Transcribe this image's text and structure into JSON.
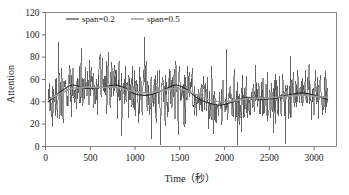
{
  "chart_data": {
    "type": "line",
    "title": "",
    "xlabel": "Time（秒）",
    "ylabel": "Attention",
    "xlim": [
      0,
      3250
    ],
    "ylim": [
      0,
      120
    ],
    "xticks": [
      0,
      500,
      1000,
      1500,
      2000,
      2500,
      3000
    ],
    "yticks": [
      0,
      20,
      40,
      60,
      80,
      100,
      120
    ],
    "xtick_labels": [
      "0",
      "500",
      "1000",
      "1500",
      "2000",
      "2500",
      "3000"
    ],
    "ytick_labels": [
      "0",
      "20",
      "40",
      "60",
      "80",
      "100",
      "120"
    ],
    "grid": false,
    "legend_position": "top-inside",
    "legend": [
      {
        "name": "span=0.2",
        "color": "#2b2b2b",
        "style": "solid"
      },
      {
        "name": "span=0.5",
        "color": "#9a9a9a",
        "style": "solid"
      }
    ],
    "series": [
      {
        "name": "attention-raw",
        "type": "noisy-line",
        "color": "#3a3a3a",
        "x_start": 30,
        "x_end": 3150,
        "n_points": 620,
        "description": "Raw per-second attention readings, high-frequency noise spanning roughly 0 to 100",
        "noise_amplitude": 22,
        "value_min": 0,
        "value_max": 100,
        "baseline_anchors_x": [
          30,
          150,
          300,
          450,
          620,
          780,
          900,
          1000,
          1150,
          1300,
          1450,
          1580,
          1700,
          1820,
          1950,
          2100,
          2250,
          2400,
          2550,
          2700,
          2850,
          3000,
          3150
        ],
        "baseline_anchors_y": [
          40,
          48,
          54,
          52,
          53,
          54,
          52,
          48,
          47,
          50,
          54,
          51,
          44,
          40,
          38,
          40,
          43,
          42,
          43,
          45,
          47,
          46,
          43
        ]
      },
      {
        "name": "span=0.2",
        "type": "smooth",
        "color": "#2b2b2b",
        "x": [
          30,
          150,
          300,
          450,
          620,
          780,
          900,
          1000,
          1150,
          1300,
          1450,
          1580,
          1700,
          1820,
          1950,
          2100,
          2250,
          2400,
          2550,
          2700,
          2850,
          3000,
          3150
        ],
        "values": [
          40,
          48,
          55,
          52,
          53,
          55,
          52,
          47,
          46,
          50,
          55,
          51,
          43,
          39,
          37,
          40,
          44,
          42,
          43,
          46,
          48,
          46,
          42
        ]
      },
      {
        "name": "span=0.5",
        "type": "smooth",
        "color": "#9a9a9a",
        "x": [
          30,
          150,
          300,
          450,
          620,
          780,
          900,
          1000,
          1150,
          1300,
          1450,
          1580,
          1700,
          1820,
          1950,
          2100,
          2250,
          2400,
          2550,
          2700,
          2850,
          3000,
          3150
        ],
        "values": [
          42,
          47,
          52,
          53,
          53,
          53,
          51,
          49,
          48,
          50,
          52,
          50,
          46,
          42,
          40,
          41,
          43,
          43,
          44,
          45,
          46,
          45,
          44
        ]
      }
    ]
  },
  "axes": {
    "y_title": "Attention",
    "x_title": "Time（秒）"
  },
  "colors": {
    "frame": "#6b6b6b",
    "noise": "#3a3a3a",
    "smooth_dark": "#2b2b2b",
    "smooth_light": "#9a9a9a",
    "background": "#ffffff"
  }
}
